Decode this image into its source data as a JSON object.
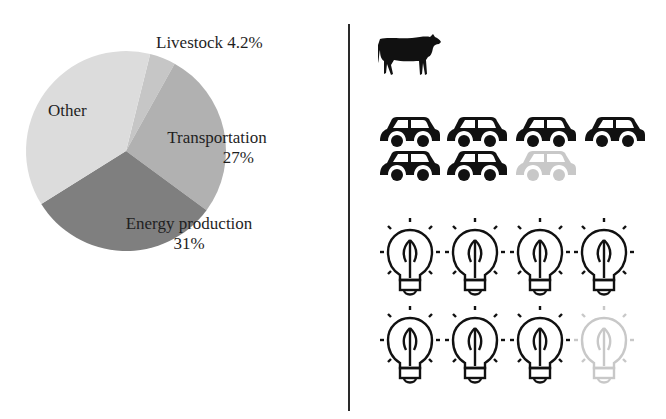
{
  "chart_data": {
    "type": "pie",
    "title": "",
    "slices": [
      {
        "label": "Livestock",
        "value": 4.2,
        "value_label": "4.2%",
        "color": "#c6c6c6"
      },
      {
        "label": "Transportation",
        "value": 27,
        "value_label": "27%",
        "color": "#b1b1b1"
      },
      {
        "label": "Energy production",
        "value": 31,
        "value_label": "31%",
        "color": "#7f7f7f"
      },
      {
        "label": "Other",
        "value": 37.8,
        "value_label": "",
        "color": "#dcdcdc"
      }
    ],
    "start_angle_deg": 14,
    "direction": "clockwise",
    "labels": {
      "livestock": "Livestock 4.2%",
      "transportation": "Transportation",
      "transportation_pct": "27%",
      "energy": "Energy production",
      "energy_pct": "31%",
      "other": "Other"
    }
  },
  "pictogram": {
    "rows": [
      {
        "category": "Livestock",
        "icon": "cow-icon",
        "units": 1,
        "full": 1,
        "faded": 0
      },
      {
        "category": "Transportation",
        "icon": "car-icon",
        "units": 7,
        "full": 6,
        "faded": 1
      },
      {
        "category": "Energy production",
        "icon": "lightbulb-leaf-icon",
        "units": 8,
        "full": 7,
        "faded": 1
      }
    ],
    "colors": {
      "full": "#111111",
      "faded": "#c8c8c8"
    }
  }
}
